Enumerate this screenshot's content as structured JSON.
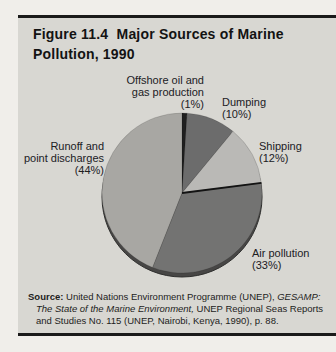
{
  "header": {
    "title_lines": [
      "Figure 11.4  Major Sources of Marine",
      "Pollution, 1990"
    ]
  },
  "chart_data": {
    "type": "pie",
    "title": "Figure 11.4 Major Sources of Marine Pollution, 1990",
    "unit": "percent",
    "start_angle_deg": 0,
    "direction": "clockwise",
    "slices": [
      {
        "label": "Offshore oil and gas production",
        "value": 1,
        "color": "#1f1f1f"
      },
      {
        "label": "Dumping",
        "value": 10,
        "color": "#6c6c6c"
      },
      {
        "label": "Shipping",
        "value": 12,
        "color": "#bab9b6"
      },
      {
        "label": "Air pollution",
        "value": 33,
        "color": "#737372",
        "divider_line": true
      },
      {
        "label": "Runoff and point discharges",
        "value": 44,
        "color": "#a8a7a3"
      }
    ],
    "depth_rim_color": "#474645",
    "legend_position": "callout-labels"
  },
  "callouts": {
    "offshore": {
      "lines": [
        "Offshore oil and",
        "gas production",
        "(1%)"
      ]
    },
    "dumping": {
      "lines": [
        "Dumping",
        "(10%)"
      ]
    },
    "shipping": {
      "lines": [
        "Shipping",
        "(12%)"
      ]
    },
    "runoff": {
      "lines": [
        "Runoff and",
        "point discharges",
        "(44%)"
      ]
    },
    "air": {
      "lines": [
        "Air pollution",
        "(33%)"
      ]
    }
  },
  "source": {
    "segments": [
      {
        "text": "Source:",
        "bold": true
      },
      {
        "text": " United Nations Environment Programme (UNEP), "
      },
      {
        "text": "GESAMP: The State of the Marine Environment,",
        "italic": true
      },
      {
        "text": " UNEP Regional Seas Reports and Studies No. 115 (UNEP, Nairobi, Kenya, 1990), p. 88."
      }
    ]
  }
}
